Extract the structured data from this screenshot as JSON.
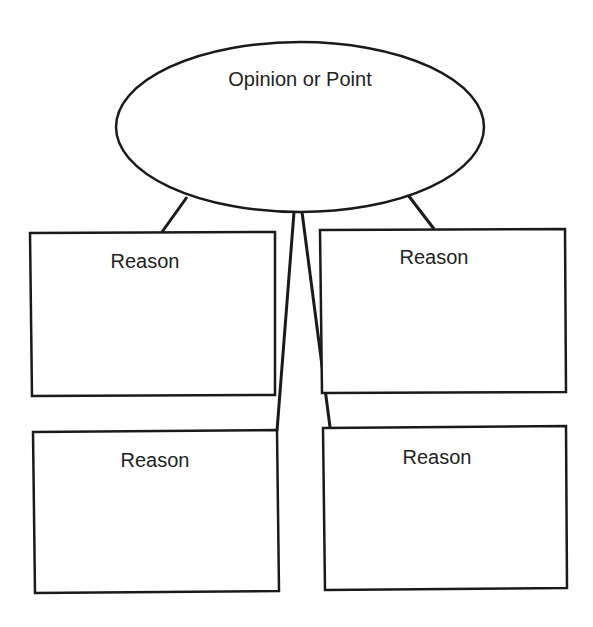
{
  "diagram": {
    "title": "Opinion or Point",
    "reasons": [
      {
        "label": "Reason"
      },
      {
        "label": "Reason"
      },
      {
        "label": "Reason"
      },
      {
        "label": "Reason"
      }
    ]
  },
  "colors": {
    "stroke": "#1a1a1a",
    "text": "#222222",
    "background": "#ffffff"
  }
}
